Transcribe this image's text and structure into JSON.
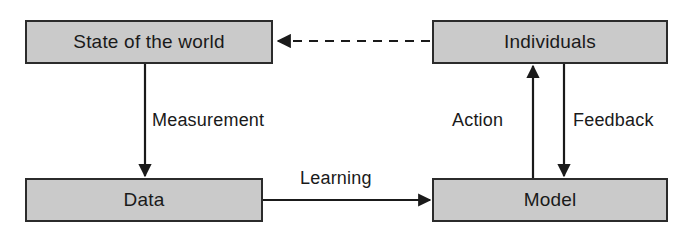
{
  "diagram": {
    "colors": {
      "node_fill": "#cacaca",
      "node_stroke": "#2b2b2b",
      "edge_stroke": "#1a1a1a",
      "text": "#1a1a1a",
      "background": "#ffffff"
    },
    "nodes": [
      {
        "id": "state",
        "label": "State of the world"
      },
      {
        "id": "individuals",
        "label": "Individuals"
      },
      {
        "id": "data",
        "label": "Data"
      },
      {
        "id": "model",
        "label": "Model"
      }
    ],
    "edges": [
      {
        "id": "measurement",
        "label": "Measurement",
        "from": "state",
        "to": "data",
        "style": "solid",
        "direction": "down"
      },
      {
        "id": "learning",
        "label": "Learning",
        "from": "data",
        "to": "model",
        "style": "solid",
        "direction": "right"
      },
      {
        "id": "action",
        "label": "Action",
        "from": "model",
        "to": "individuals",
        "style": "solid",
        "direction": "up"
      },
      {
        "id": "feedback",
        "label": "Feedback",
        "from": "individuals",
        "to": "model",
        "style": "solid",
        "direction": "down"
      },
      {
        "id": "influence",
        "label": "",
        "from": "individuals",
        "to": "state",
        "style": "dashed",
        "direction": "left"
      }
    ]
  }
}
